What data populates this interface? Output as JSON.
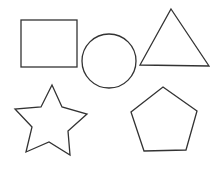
{
  "diagram": {
    "background": "#ffffff",
    "stroke_color": "#333333",
    "shapes": [
      {
        "name": "rectangle",
        "x": 21,
        "y": 20,
        "width": 56,
        "height": 47
      },
      {
        "name": "circle",
        "cx": 109,
        "cy": 61,
        "r": 27
      },
      {
        "name": "triangle",
        "points": "171,9 209,66 140,65"
      },
      {
        "name": "star",
        "points": "52,85 62,107 87,114 68,131 70,155 49,142 26,152 32,127 15,109 41,107"
      },
      {
        "name": "pentagon",
        "points": "163,87 197,111 186,150 144,151 131,112"
      }
    ]
  }
}
